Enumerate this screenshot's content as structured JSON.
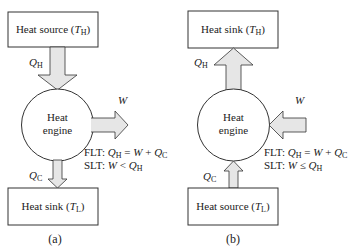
{
  "panels": [
    {
      "id": "a",
      "caption": "(a)",
      "top_box": {
        "text": "Heat source (",
        "var": "T",
        "sub": "H",
        "close": ")"
      },
      "bottom_box": {
        "text": "Heat sink (",
        "var": "T",
        "sub": "L",
        "close": ")"
      },
      "engine": {
        "line1": "Heat",
        "line2": "engine"
      },
      "q_top": {
        "var": "Q",
        "sub": "H",
        "direction": "down"
      },
      "q_bottom": {
        "var": "Q",
        "sub": "C",
        "direction": "down"
      },
      "work": {
        "var": "W",
        "direction": "out"
      },
      "flt": {
        "prefix": "FLT: ",
        "q": "Q",
        "qsub": "H",
        "eq": " = ",
        "w": "W",
        "plus": " + ",
        "q2": "Q",
        "q2sub": "C"
      },
      "slt": {
        "prefix": "SLT: ",
        "w": "W",
        "rel": " < ",
        "q": "Q",
        "qsub": "H"
      }
    },
    {
      "id": "b",
      "caption": "(b)",
      "top_box": {
        "text": "Heat sink (",
        "var": "T",
        "sub": "H",
        "close": ")"
      },
      "bottom_box": {
        "text": "Heat source (",
        "var": "T",
        "sub": "L",
        "close": ")"
      },
      "engine": {
        "line1": "Heat",
        "line2": "engine"
      },
      "q_top": {
        "var": "Q",
        "sub": "H",
        "direction": "up"
      },
      "q_bottom": {
        "var": "Q",
        "sub": "C",
        "direction": "up"
      },
      "work": {
        "var": "W",
        "direction": "in"
      },
      "flt": {
        "prefix": "FLT: ",
        "q": "Q",
        "qsub": "H",
        "eq": " = ",
        "w": "W",
        "plus": " + ",
        "q2": "Q",
        "q2sub": "C"
      },
      "slt": {
        "prefix": "SLT: ",
        "w": "W",
        "rel": " ≤ ",
        "q": "Q",
        "qsub": "H"
      }
    }
  ],
  "colors": {
    "stroke": "#333333",
    "arrow_fill": "#e6e6e6",
    "background": "#ffffff"
  }
}
